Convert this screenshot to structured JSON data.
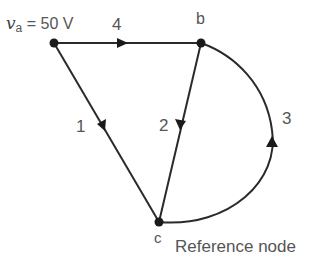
{
  "diagram": {
    "type": "network-graph",
    "colors": {
      "edge": "#2a2a2a",
      "node": "#1a1a1a",
      "text": "#555555"
    },
    "source_label": {
      "var": "v",
      "sub": "a",
      "rest": " = 50 V"
    },
    "nodes": [
      {
        "id": "a",
        "label": "",
        "x": 54,
        "y": 43
      },
      {
        "id": "b",
        "label": "b",
        "x": 201,
        "y": 43
      },
      {
        "id": "c",
        "label": "c",
        "x": 159,
        "y": 222
      }
    ],
    "edges": [
      {
        "id": "1",
        "label": "1",
        "from": "a",
        "to": "c",
        "shape": "line"
      },
      {
        "id": "2",
        "label": "2",
        "from": "b",
        "to": "c",
        "shape": "line"
      },
      {
        "id": "3",
        "label": "3",
        "from": "c",
        "to": "b",
        "shape": "arc"
      },
      {
        "id": "4",
        "label": "4",
        "from": "a",
        "to": "b",
        "shape": "line"
      }
    ],
    "reference_label": "Reference node"
  }
}
